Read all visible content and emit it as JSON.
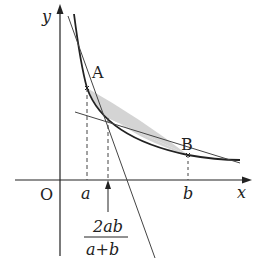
{
  "diagram": {
    "type": "graph-of-curve-with-tangents",
    "axes": {
      "x_label": "x",
      "y_label": "y",
      "origin_label": "O"
    },
    "points": [
      {
        "name": "A",
        "label": "A"
      },
      {
        "name": "B",
        "label": "B"
      }
    ],
    "x_ticks": [
      {
        "label": "a"
      },
      {
        "label": "b"
      }
    ],
    "annotation": {
      "numerator": "2ab",
      "denominator": "a+b"
    },
    "colors": {
      "line": "#222222",
      "shade": "#cfcfcf"
    }
  }
}
